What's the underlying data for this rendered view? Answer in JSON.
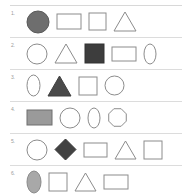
{
  "document": {
    "title": "Shape rows worksheet",
    "background_color": "#ffffff",
    "rule_color": "#dcdcdc",
    "outline_color": "#8c8c8c",
    "number_color": "#9a9a9a"
  },
  "rows": [
    {
      "number": "1.",
      "shapes": [
        {
          "name": "circle",
          "fill": "#6e6e6e",
          "stroke": "#5a5a5a",
          "w": 24,
          "h": 24
        },
        {
          "name": "rectangle",
          "fill": "none",
          "stroke": "#8c8c8c",
          "w": 26,
          "h": 17
        },
        {
          "name": "square",
          "fill": "none",
          "stroke": "#8c8c8c",
          "w": 19,
          "h": 19
        },
        {
          "name": "triangle",
          "fill": "none",
          "stroke": "#8c8c8c",
          "w": 24,
          "h": 21
        }
      ]
    },
    {
      "number": "2.",
      "shapes": [
        {
          "name": "circle",
          "fill": "none",
          "stroke": "#8c8c8c",
          "w": 22,
          "h": 22
        },
        {
          "name": "triangle",
          "fill": "none",
          "stroke": "#8c8c8c",
          "w": 24,
          "h": 21
        },
        {
          "name": "square",
          "fill": "#3d3d3d",
          "stroke": "#333333",
          "w": 21,
          "h": 21
        },
        {
          "name": "rectangle",
          "fill": "none",
          "stroke": "#8c8c8c",
          "w": 26,
          "h": 16
        },
        {
          "name": "ellipse",
          "fill": "none",
          "stroke": "#8c8c8c",
          "w": 14,
          "h": 22
        }
      ]
    },
    {
      "number": "3.",
      "shapes": [
        {
          "name": "ellipse",
          "fill": "none",
          "stroke": "#8c8c8c",
          "w": 15,
          "h": 23
        },
        {
          "name": "triangle",
          "fill": "#4a4a4a",
          "stroke": "#3f3f3f",
          "w": 25,
          "h": 22
        },
        {
          "name": "square",
          "fill": "none",
          "stroke": "#8c8c8c",
          "w": 20,
          "h": 20
        },
        {
          "name": "circle",
          "fill": "none",
          "stroke": "#8c8c8c",
          "w": 21,
          "h": 21
        }
      ]
    },
    {
      "number": "4.",
      "shapes": [
        {
          "name": "rectangle",
          "fill": "#9a9a9a",
          "stroke": "#6e6e6e",
          "w": 27,
          "h": 17
        },
        {
          "name": "circle",
          "fill": "none",
          "stroke": "#8c8c8c",
          "w": 22,
          "h": 22
        },
        {
          "name": "ellipse",
          "fill": "none",
          "stroke": "#8c8c8c",
          "w": 14,
          "h": 22
        },
        {
          "name": "octagon",
          "fill": "none",
          "stroke": "#8c8c8c",
          "w": 21,
          "h": 21
        }
      ]
    },
    {
      "number": "5.",
      "shapes": [
        {
          "name": "circle",
          "fill": "none",
          "stroke": "#8c8c8c",
          "w": 22,
          "h": 22
        },
        {
          "name": "diamond",
          "fill": "#424242",
          "stroke": "#383838",
          "w": 23,
          "h": 23
        },
        {
          "name": "rectangle",
          "fill": "none",
          "stroke": "#8c8c8c",
          "w": 25,
          "h": 16
        },
        {
          "name": "triangle",
          "fill": "none",
          "stroke": "#8c8c8c",
          "w": 23,
          "h": 20
        },
        {
          "name": "square",
          "fill": "none",
          "stroke": "#8c8c8c",
          "w": 20,
          "h": 20
        }
      ]
    },
    {
      "number": "6.",
      "shapes": [
        {
          "name": "ellipse",
          "fill": "#a8a8a8",
          "stroke": "#8a8a8a",
          "w": 16,
          "h": 24
        },
        {
          "name": "square",
          "fill": "none",
          "stroke": "#8c8c8c",
          "w": 20,
          "h": 20
        },
        {
          "name": "triangle",
          "fill": "none",
          "stroke": "#8c8c8c",
          "w": 23,
          "h": 20
        },
        {
          "name": "rectangle",
          "fill": "none",
          "stroke": "#8c8c8c",
          "w": 26,
          "h": 16
        }
      ]
    }
  ]
}
